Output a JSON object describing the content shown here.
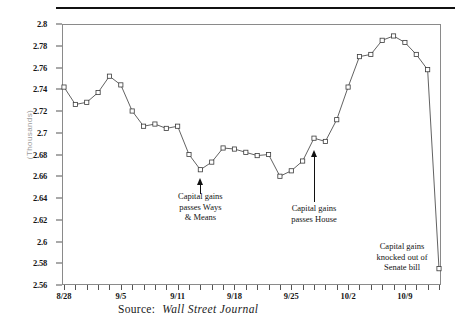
{
  "chart_data": {
    "type": "line",
    "title": "",
    "xlabel": "",
    "ylabel": "(Thousands)",
    "ylim": [
      2.56,
      2.8
    ],
    "ytick_step": 0.02,
    "ytick_labels": [
      "2.8",
      "2.78",
      "2.76",
      "2.74",
      "2.72",
      "2.7",
      "2.68",
      "2.66",
      "2.64",
      "2.62",
      "2.6",
      "2.58",
      "2.56"
    ],
    "ytick_values": [
      2.8,
      2.78,
      2.76,
      2.74,
      2.72,
      2.7,
      2.68,
      2.66,
      2.64,
      2.62,
      2.6,
      2.58,
      2.56
    ],
    "xtick_labels": [
      "8/28",
      "9/5",
      "9/11",
      "9/18",
      "9/25",
      "10/2",
      "10/9"
    ],
    "xtick_indices": [
      0,
      5,
      10,
      15,
      20,
      25,
      30
    ],
    "grid": false,
    "legend": "none",
    "marker": "open-square",
    "series": [
      {
        "name": "Index",
        "values": [
          2.742,
          2.726,
          2.728,
          2.737,
          2.752,
          2.744,
          2.72,
          2.706,
          2.708,
          2.704,
          2.706,
          2.68,
          2.666,
          2.673,
          2.686,
          2.685,
          2.682,
          2.679,
          2.68,
          2.66,
          2.665,
          2.674,
          2.695,
          2.692,
          2.712,
          2.742,
          2.77,
          2.772,
          2.785,
          2.789,
          2.783,
          2.772,
          2.758,
          2.575
        ]
      }
    ],
    "annotations": [
      {
        "id": "ways-and-means",
        "text": "Capital gains\npasses Ways\n& Means",
        "point_index": 12,
        "point_value": 2.666
      },
      {
        "id": "passes-house",
        "text": "Capital gains\npasses House",
        "point_index": 22,
        "point_value": 2.695
      },
      {
        "id": "senate-bill",
        "text": "Capital gains\nknocked out of\nSenate bill",
        "point_index": 33,
        "point_value": 2.575
      }
    ]
  },
  "caption": {
    "source_label": "Source:",
    "source_name": "Wall Street Journal"
  },
  "colors": {
    "line": "#3a3a3a",
    "marker_stroke": "#3a3a3a",
    "marker_fill": "#ffffff",
    "frame": "#8a8a8a",
    "text": "#1a1a1a",
    "axis_title": "#9a9a9a"
  }
}
